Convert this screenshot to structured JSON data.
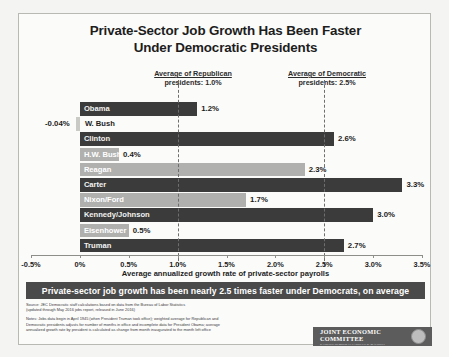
{
  "chart_data": {
    "type": "bar",
    "orientation": "horizontal",
    "title": "Private-Sector Job Growth Has Been Faster Under Democratic Presidents",
    "title_line1": "Private-Sector Job Growth Has Been Faster",
    "title_line2": "Under Democratic Presidents",
    "xlabel": "Average annualized growth rate of private-sector payrolls",
    "ylabel": "",
    "xlim": [
      -0.5,
      3.5
    ],
    "xticks": [
      "-0.5%",
      "0%",
      "0.5%",
      "1.0%",
      "1.5%",
      "2.0%",
      "2.5%",
      "3.0%",
      "3.5%"
    ],
    "xtick_values": [
      -0.5,
      0,
      0.5,
      1.0,
      1.5,
      2.0,
      2.5,
      3.0,
      3.5
    ],
    "grid": false,
    "legend": "none",
    "categories": [
      "Obama",
      "W. Bush",
      "Clinton",
      "H.W. Bush",
      "Reagan",
      "Carter",
      "Nixon/Ford",
      "Kennedy/Johnson",
      "Eisenhower",
      "Truman"
    ],
    "values": [
      1.2,
      -0.04,
      2.6,
      0.4,
      2.3,
      3.3,
      1.7,
      3.0,
      0.5,
      2.7
    ],
    "value_labels": [
      "1.2%",
      "-0.04%",
      "2.6%",
      "0.4%",
      "2.3%",
      "3.3%",
      "1.7%",
      "3.0%",
      "0.5%",
      "2.7%"
    ],
    "party": [
      "democratic",
      "republican",
      "democratic",
      "republican",
      "republican",
      "democratic",
      "republican",
      "democratic",
      "republican",
      "democratic"
    ],
    "annotations": [
      {
        "name": "republican-average",
        "line1": "Average of Republican",
        "line2": "presidents: 1.0%",
        "value": 1.0
      },
      {
        "name": "democratic-average",
        "line1": "Average of Democratic",
        "line2": "presidents: 2.5%",
        "value": 2.5
      }
    ],
    "colors": {
      "democratic_bar": "#3b3b3b",
      "republican_bar": "#b0b0ae",
      "reference_line": "#6e6e6e",
      "banner": "#4a4a4a"
    }
  },
  "banner": {
    "text": "Private-sector job growth has been nearly 2.5 times faster under Democrats, on average"
  },
  "footnotes": {
    "source_line1": "Source: JEC Democratic staff calculations based on data from the Bureau of Labor Statistics",
    "source_line2": "(updated through May 2016 jobs report, released in June 2016)",
    "notes_line1": "Notes: Jobs data begin in April 1945 (when President Truman took office); weighted average for Republican and",
    "notes_line2": "Democratic presidents adjusts for number of months in office and incomplete data for President Obama; average",
    "notes_line3": "annualized growth rate by president is calculated as change from month inaugurated to the month left office"
  },
  "logo": {
    "title": "JOINT ECONOMIC COMMITTEE",
    "subtitle": "RANKING DEMOCRAT CAROLYN B. MALONEY",
    "seal": "congressional-seal-icon"
  }
}
